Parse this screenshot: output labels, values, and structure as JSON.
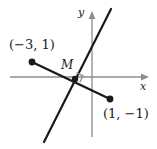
{
  "figure": {
    "type": "coordinate-geometry-diagram",
    "background_color": "#ffffff",
    "ink_color": "#1a1a1a",
    "axis_color": "#8c8c8c",
    "width": 157,
    "height": 149
  },
  "axes": {
    "x_label": "x",
    "y_label": "y",
    "origin_px": {
      "x": 92,
      "y": 77
    },
    "x_axis_px": {
      "x1": 10,
      "y1": 77,
      "x2": 149,
      "y2": 77
    },
    "y_axis_px": {
      "x1": 92,
      "y1": 137,
      "x2": 92,
      "y2": 11
    },
    "x_arrow": true,
    "y_arrow": true,
    "grid": false,
    "tick_labels": []
  },
  "points": [
    {
      "name": "point-a",
      "label": "(−3, 1)",
      "coords": [
        -3,
        1
      ],
      "px": {
        "x": 32,
        "y": 62
      },
      "marker": "filled-circle"
    },
    {
      "name": "point-b",
      "label": "(1, −1)",
      "coords": [
        1,
        -1
      ],
      "px": {
        "x": 110,
        "y": 99
      },
      "marker": "filled-circle"
    },
    {
      "name": "midpoint",
      "label": "M",
      "coords": [
        -1,
        0
      ],
      "px": {
        "x": 75,
        "y": 79
      },
      "marker": "filled-circle"
    }
  ],
  "segments": [
    {
      "name": "segment-ab",
      "from_px": {
        "x": 32,
        "y": 62
      },
      "to_px": {
        "x": 110,
        "y": 99
      },
      "style": "solid",
      "width": 2.2
    },
    {
      "name": "perpendicular-bisector",
      "from_px": {
        "x": 44,
        "y": 142
      },
      "to_px": {
        "x": 111,
        "y": 9
      },
      "style": "solid",
      "width": 2.2
    }
  ],
  "markers": {
    "right_angle": {
      "name": "right-angle-marker",
      "at_px": {
        "x": 75,
        "y": 79
      },
      "size_px": 9,
      "color": "#8c8c8c"
    }
  }
}
